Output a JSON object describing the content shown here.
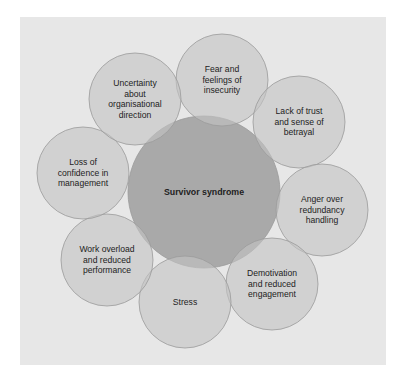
{
  "diagram": {
    "type": "radial-overlapping-circles",
    "colors": {
      "background": "#ffffff",
      "panel": "#e7e7e7",
      "center_fill": "#a9a9a9",
      "satellite_fill": "#c4c4c4",
      "stroke": "#9a9a9a",
      "text": "#222222"
    },
    "center": {
      "label": "Survivor syndrome",
      "cx": 204,
      "cy": 192,
      "r": 76
    },
    "satellites": [
      {
        "label": "Fear and\nfeelings of\ninsecurity",
        "cx": 222,
        "cy": 80,
        "r": 46
      },
      {
        "label": "Lack of trust\nand sense of\nbetrayal",
        "cx": 299,
        "cy": 122,
        "r": 46
      },
      {
        "label": "Anger over\nredundancy\nhandling",
        "cx": 322,
        "cy": 210,
        "r": 46
      },
      {
        "label": "Demotivation\nand reduced\nengagement",
        "cx": 272,
        "cy": 284,
        "r": 46
      },
      {
        "label": "Stress",
        "cx": 185,
        "cy": 302,
        "r": 46
      },
      {
        "label": "Work overload\nand reduced\nperformance",
        "cx": 107,
        "cy": 260,
        "r": 46
      },
      {
        "label": "Loss of\nconfidence in\nmanagement",
        "cx": 83,
        "cy": 173,
        "r": 46
      },
      {
        "label": "Uncertainty\nabout\norganisational\ndirection",
        "cx": 135,
        "cy": 99,
        "r": 46
      }
    ]
  }
}
